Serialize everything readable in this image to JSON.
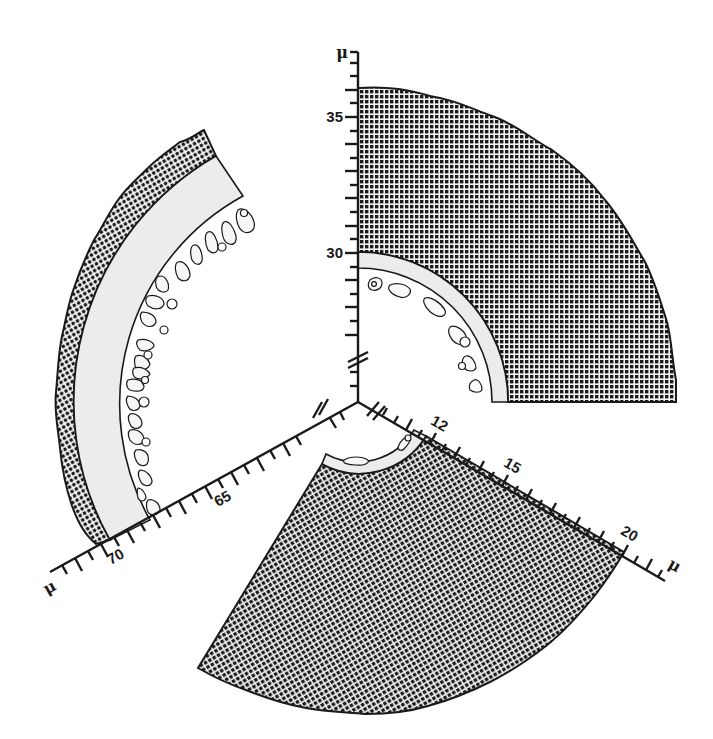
{
  "figure": {
    "colors": {
      "ink": "#1a1a1a",
      "hatch_bg": "#f4f4f4",
      "light_band": "#ececec",
      "paper": "#ffffff"
    },
    "center": {
      "x": 358,
      "y": 402
    },
    "sectors": [
      {
        "id": "top-right",
        "axis_unit": "μ",
        "axis_ticks": [
          "30",
          "35"
        ],
        "axis_break": true,
        "angle_start_deg": 0,
        "angle_end_deg": 90,
        "outer_radius_px": 314,
        "hatch_inner_radius_px": 150,
        "band_inner_radius_px": 134
      },
      {
        "id": "left",
        "axis_unit": "μ",
        "axis_ticks": [
          "65",
          "70"
        ],
        "axis_break": true,
        "angle_start_deg": 119,
        "angle_end_deg": 208,
        "outer_radius_px": 310,
        "hatch_inner_radius_px": 283,
        "band_inner_radius_px": 237
      },
      {
        "id": "bottom",
        "axis_unit": "μ",
        "axis_ticks": [
          "12",
          "15",
          "20"
        ],
        "axis_break": true,
        "angle_start_deg": 238,
        "angle_end_deg": 331,
        "outer_radius_px": 312,
        "hatch_inner_radius_px": 78,
        "band_inner_radius_px": 66
      }
    ],
    "labels": {
      "top_unit": "μ",
      "top_35": "35",
      "top_30": "30",
      "left_unit": "μ",
      "left_65": "65",
      "left_70": "70",
      "right_unit": "μ",
      "right_12": "12",
      "right_15": "15",
      "right_20": "20"
    }
  }
}
